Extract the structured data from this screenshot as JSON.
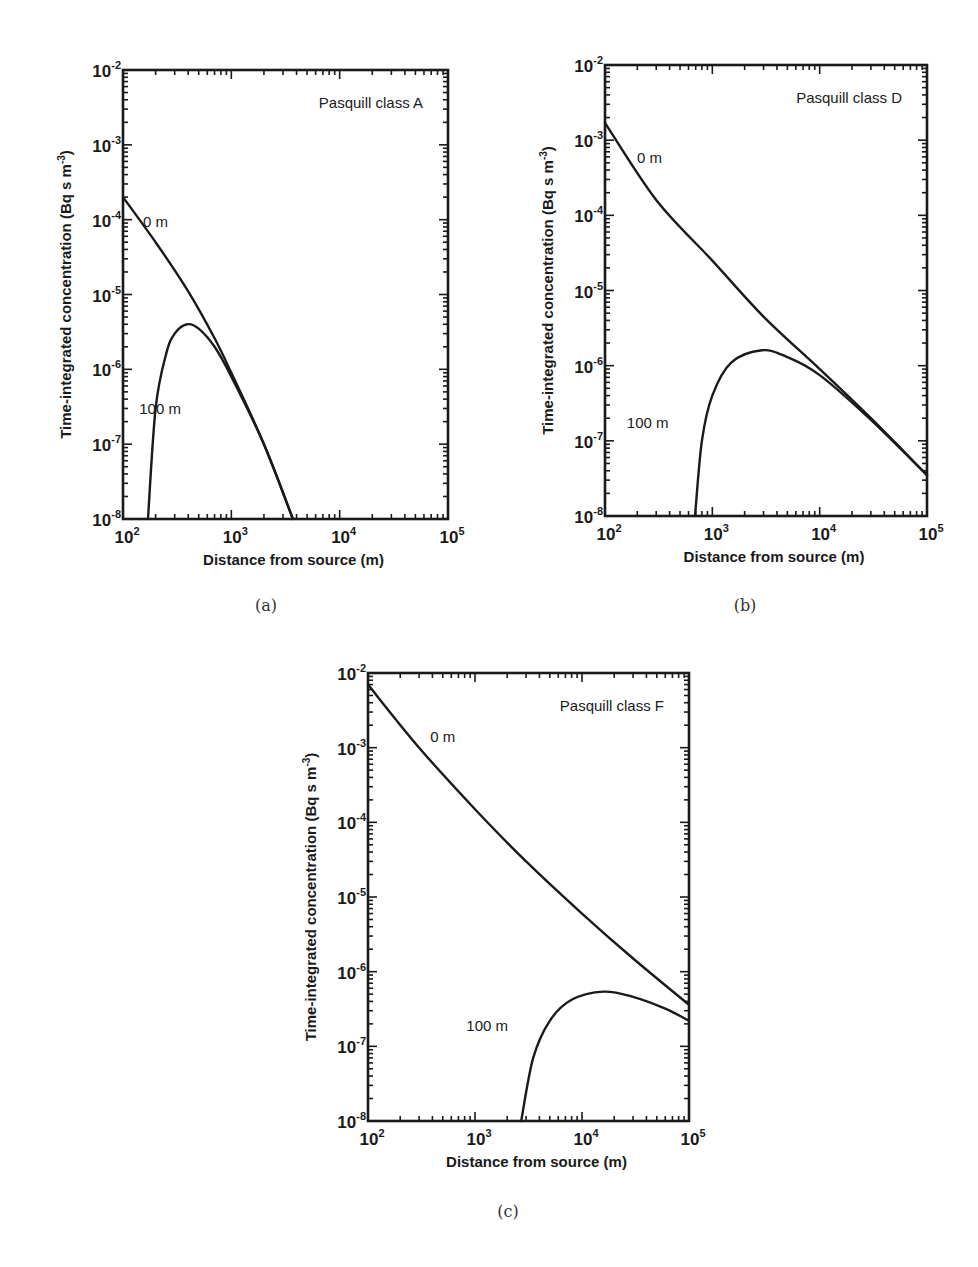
{
  "figure": {
    "captions": [
      "(a)",
      "(b)",
      "(c)"
    ],
    "xlabel": "Distance from source (m)",
    "ylabel": "Time-integrated concentration (Bq s m",
    "ylabel_sup": "-3",
    "ylabel_close": ")"
  },
  "chart_data": [
    {
      "type": "line",
      "panel": "(a)",
      "title": "Pasquill class A",
      "xlabel": "Distance from source (m)",
      "ylabel": "Time-integrated concentration (Bq s m^-3)",
      "xscale": "log",
      "yscale": "log",
      "xlim": [
        100,
        100000
      ],
      "ylim": [
        1e-08,
        0.01
      ],
      "x_ticks": [
        "10^2",
        "10^3",
        "10^4",
        "10^5"
      ],
      "y_ticks": [
        "10^-8",
        "10^-7",
        "10^-6",
        "10^-5",
        "10^-4",
        "10^-3",
        "10^-2"
      ],
      "grid": false,
      "series": [
        {
          "name": "0 m",
          "label_pos": [
            200,
            8e-05
          ],
          "x": [
            100,
            200,
            400,
            700,
            1000,
            2000,
            3700
          ],
          "y": [
            0.0002,
            5e-05,
            1.1e-05,
            2.6e-06,
            9e-07,
            1e-07,
            1e-08
          ]
        },
        {
          "name": "100 m",
          "label_pos": [
            220,
            2.5e-07
          ],
          "x": [
            170,
            200,
            250,
            300,
            390,
            500,
            700,
            1000,
            2000,
            3700
          ],
          "y": [
            1e-08,
            3e-07,
            1.6e-06,
            3e-06,
            4e-06,
            3.5e-06,
            2e-06,
            8e-07,
            1e-07,
            1e-08
          ]
        }
      ]
    },
    {
      "type": "line",
      "panel": "(b)",
      "title": "Pasquill class D",
      "xlabel": "Distance from source (m)",
      "ylabel": "Time-integrated concentration (Bq s m^-3)",
      "xscale": "log",
      "yscale": "log",
      "xlim": [
        100,
        100000
      ],
      "ylim": [
        1e-08,
        0.01
      ],
      "x_ticks": [
        "10^2",
        "10^3",
        "10^4",
        "10^5"
      ],
      "y_ticks": [
        "10^-8",
        "10^-7",
        "10^-6",
        "10^-5",
        "10^-4",
        "10^-3",
        "10^-2"
      ],
      "grid": false,
      "series": [
        {
          "name": "0 m",
          "label_pos": [
            260,
            0.0005
          ],
          "x": [
            100,
            300,
            1000,
            3000,
            10000,
            30000,
            100000
          ],
          "y": [
            0.0017,
            0.00016,
            2.5e-05,
            4.5e-06,
            9e-07,
            2e-07,
            3.5e-08
          ]
        },
        {
          "name": "100 m",
          "label_pos": [
            250,
            1.5e-07
          ],
          "x": [
            690,
            800,
            1000,
            1500,
            2900,
            5000,
            10000,
            30000,
            100000
          ],
          "y": [
            1e-08,
            1e-07,
            4e-07,
            1.1e-06,
            1.6e-06,
            1.3e-06,
            7.5e-07,
            1.9e-07,
            3.5e-08
          ]
        }
      ]
    },
    {
      "type": "line",
      "panel": "(c)",
      "title": "Pasquill class F",
      "xlabel": "Distance from source (m)",
      "ylabel": "Time-integrated concentration (Bq s m^-3)",
      "xscale": "log",
      "yscale": "log",
      "xlim": [
        100,
        100000
      ],
      "ylim": [
        1e-08,
        0.01
      ],
      "x_ticks": [
        "10^2",
        "10^3",
        "10^4",
        "10^5"
      ],
      "y_ticks": [
        "10^-8",
        "10^-7",
        "10^-6",
        "10^-5",
        "10^-4",
        "10^-3",
        "10^-2"
      ],
      "grid": false,
      "series": [
        {
          "name": "0 m",
          "label_pos": [
            500,
            0.0012
          ],
          "x": [
            100,
            300,
            1000,
            3000,
            10000,
            30000,
            100000
          ],
          "y": [
            0.007,
            0.001,
            0.00015,
            3e-05,
            6e-06,
            1.5e-06,
            3.6e-07
          ]
        },
        {
          "name": "100 m",
          "label_pos": [
            1300,
            1.6e-07
          ],
          "x": [
            2700,
            3500,
            5000,
            8000,
            16000,
            30000,
            60000,
            100000
          ],
          "y": [
            1e-08,
            7e-08,
            2.2e-07,
            4.2e-07,
            5.4e-07,
            4.6e-07,
            3.2e-07,
            2.2e-07
          ]
        }
      ]
    }
  ]
}
